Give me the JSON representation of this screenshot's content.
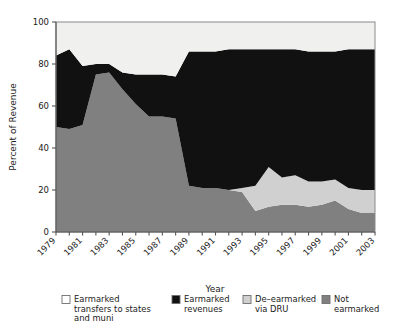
{
  "chart_data": {
    "type": "area",
    "stacked": true,
    "title": "",
    "xlabel": "Year",
    "ylabel": "Percent of Revenue",
    "xlim": [
      1979,
      2003
    ],
    "ylim": [
      0,
      100
    ],
    "yticks": [
      0,
      20,
      40,
      60,
      80,
      100
    ],
    "xticks": [
      1979,
      1981,
      1983,
      1985,
      1987,
      1989,
      1991,
      1993,
      1995,
      1997,
      1999,
      2001,
      2003
    ],
    "xtick_labels": [
      "1979",
      "1981",
      "1983",
      "1985",
      "1987",
      "1989",
      "1991",
      "1993",
      "1995",
      "1997",
      "1999",
      "2001",
      "2003"
    ],
    "grid": false,
    "legend_position": "bottom",
    "x": [
      1979,
      1980,
      1981,
      1982,
      1983,
      1984,
      1985,
      1986,
      1987,
      1988,
      1989,
      1990,
      1991,
      1992,
      1993,
      1994,
      1995,
      1996,
      1997,
      1998,
      1999,
      2000,
      2001,
      2002,
      2003
    ],
    "series": [
      {
        "name": "Not earmarked",
        "color": "#808080",
        "values": [
          50,
          49,
          51,
          75,
          76,
          68,
          61,
          55,
          55,
          54,
          22,
          21,
          21,
          20,
          19,
          10,
          12,
          13,
          13,
          12,
          13,
          15,
          11,
          9,
          9
        ]
      },
      {
        "name": "De-earmarked via DRU",
        "color": "#d0d0d0",
        "values": [
          0,
          0,
          0,
          0,
          0,
          0,
          0,
          0,
          0,
          0,
          0,
          0,
          0,
          0,
          2,
          12,
          19,
          13,
          14,
          12,
          11,
          10,
          10,
          11,
          11
        ]
      },
      {
        "name": "Earmarked revenues",
        "color": "#111111",
        "values": [
          34,
          38,
          28,
          5,
          4,
          8,
          14,
          20,
          20,
          20,
          64,
          65,
          65,
          67,
          66,
          65,
          56,
          61,
          60,
          62,
          62,
          61,
          66,
          67,
          67
        ]
      },
      {
        "name": "Earmarked transfers to states and muni",
        "color": "#f0f0ee",
        "values": [
          16,
          13,
          21,
          20,
          20,
          24,
          25,
          25,
          25,
          26,
          14,
          14,
          14,
          13,
          13,
          13,
          13,
          13,
          13,
          14,
          14,
          14,
          13,
          13,
          13
        ]
      }
    ]
  },
  "legend": {
    "items": [
      {
        "label_line1": "Earmarked",
        "label_line2": "transfers to states",
        "label_line3": "and muni",
        "color": "#ffffff"
      },
      {
        "label_line1": "Earmarked",
        "label_line2": "revenues",
        "label_line3": "",
        "color": "#111111"
      },
      {
        "label_line1": "De–earmarked",
        "label_line2": "via DRU",
        "label_line3": "",
        "color": "#d0d0d0"
      },
      {
        "label_line1": "Not",
        "label_line2": "earmarked",
        "label_line3": "",
        "color": "#808080"
      }
    ]
  },
  "axes": {
    "y_title": "Percent of Revenue",
    "x_title": "Year",
    "ytick_labels": [
      "0",
      "20",
      "40",
      "60",
      "80",
      "100"
    ]
  }
}
